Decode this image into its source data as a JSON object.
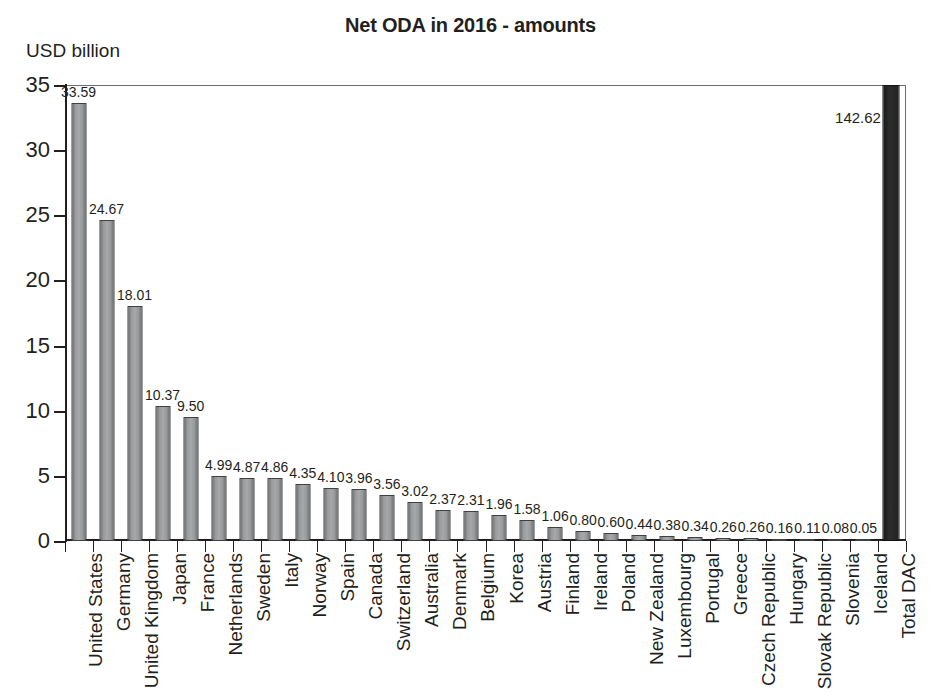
{
  "chart_data": {
    "type": "bar",
    "title": "Net ODA in 2016 - amounts",
    "ylabel": "USD billion",
    "xlabel": "",
    "ylim": [
      0,
      35
    ],
    "yticks": [
      0,
      5,
      10,
      15,
      20,
      25,
      30,
      35
    ],
    "grid": false,
    "legend": "none",
    "note": "Total DAC bar (142.62) is clipped by the 0-35 axis range and drawn in dark fill",
    "categories": [
      "United States",
      "Germany",
      "United Kingdom",
      "Japan",
      "France",
      "Netherlands",
      "Sweden",
      "Italy",
      "Norway",
      "Spain",
      "Canada",
      "Switzerland",
      "Australia",
      "Denmark",
      "Belgium",
      "Korea",
      "Austria",
      "Finland",
      "Ireland",
      "Poland",
      "New Zealand",
      "Luxembourg",
      "Portugal",
      "Greece",
      "Czech Republic",
      "Hungary",
      "Slovak Republic",
      "Slovenia",
      "Iceland",
      "Total DAC"
    ],
    "values": [
      33.59,
      24.67,
      18.01,
      10.37,
      9.5,
      4.99,
      4.87,
      4.86,
      4.35,
      4.1,
      3.96,
      3.56,
      3.02,
      2.37,
      2.31,
      1.96,
      1.58,
      1.06,
      0.8,
      0.6,
      0.44,
      0.38,
      0.34,
      0.26,
      0.26,
      0.16,
      0.11,
      0.08,
      0.05,
      142.62
    ],
    "value_labels": [
      "33.59",
      "24.67",
      "18.01",
      "10.37",
      "9.50",
      "4.99",
      "4.87",
      "4.86",
      "4.35",
      "4.10",
      "3.96",
      "3.56",
      "3.02",
      "2.37",
      "2.31",
      "1.96",
      "1.58",
      "1.06",
      "0.80",
      "0.60",
      "0.44",
      "0.38",
      "0.34",
      "0.26",
      "0.26",
      "0.16",
      "0.11",
      "0.08",
      "0.05",
      "142.62"
    ],
    "ytick_labels": [
      "0",
      "5",
      "10",
      "15",
      "20",
      "25",
      "30",
      "35"
    ],
    "colors": {
      "bar_fill": "#a7a8aa",
      "bar_edge": "#3f4042",
      "total_bar_fill": "#222222",
      "axis": "#231f20",
      "frame": "#6d6e71",
      "text": "#231f20",
      "background": "#ffffff"
    }
  }
}
